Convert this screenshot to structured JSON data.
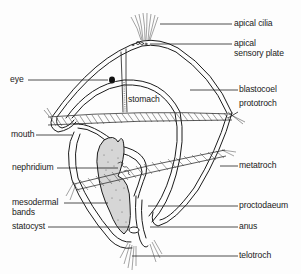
{
  "diagram": {
    "labels": {
      "apical_cilia": "apical cilia",
      "apical_sensory_plate_line1": "apical",
      "apical_sensory_plate_line2": "sensory plate",
      "eye": "eye",
      "stomach": "stomach",
      "blastocoel": "blastocoel",
      "prototroch": "prototroch",
      "mouth": "mouth",
      "nephridium": "nephridium",
      "metatroch": "metatroch",
      "mesodermal_bands_line1": "mesodermal",
      "mesodermal_bands_line2": "bands",
      "proctodaeum": "proctodaeum",
      "statocyst": "statocyst",
      "anus": "anus",
      "telotroch": "telotroch"
    },
    "colors": {
      "ink": "#1c1c1c",
      "background": "#fdfdfd"
    }
  }
}
